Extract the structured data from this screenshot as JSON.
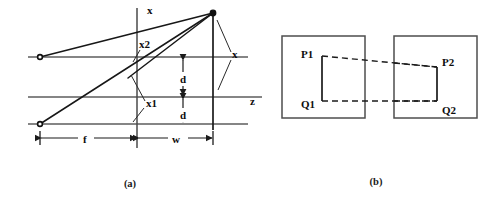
{
  "figure": {
    "panels": [
      {
        "id": "a",
        "caption": "(a)",
        "caption_pos": {
          "x": 130,
          "y": 186
        },
        "description": "Ray diagram with vertical x axis, horizontal z axis, three horizontal reference lines, two source points and one apex point.",
        "labels": {
          "x_axis_top": "x",
          "z_axis": "z",
          "x_right": "x",
          "x1": "x1",
          "x2": "x2",
          "d_upper": "d",
          "d_lower": "d",
          "f": "f",
          "w": "w"
        }
      },
      {
        "id": "b",
        "caption": "(b)",
        "caption_pos": {
          "x": 376,
          "y": 184
        },
        "description": "Two image frames with corresponding vertical segments linked by dashed correspondence lines.",
        "labels": {
          "p1": "P1",
          "q1": "Q1",
          "p2": "P2",
          "q2": "Q2"
        }
      }
    ]
  },
  "panel_a": {
    "horizontal_lines": [
      {
        "name": "upper-reference-line",
        "x1": 28,
        "y": 57,
        "x2": 248
      },
      {
        "name": "middle-axis-line",
        "x1": 28,
        "y": 97,
        "x2": 262
      },
      {
        "name": "lower-reference-line",
        "x1": 28,
        "y": 124,
        "x2": 248
      }
    ],
    "vertical_axis": {
      "name": "x-axis",
      "x": 137,
      "y1": 8,
      "y2": 148
    },
    "right_vertical": {
      "name": "image-plane-bar",
      "x": 213,
      "y1": 13,
      "y2": 130
    },
    "points": [
      {
        "name": "upper-left-source",
        "x": 40,
        "y": 57,
        "style": "open"
      },
      {
        "name": "lower-left-source",
        "x": 40,
        "y": 124,
        "style": "open"
      },
      {
        "name": "apex-point",
        "x": 213,
        "y": 13,
        "style": "filled"
      }
    ],
    "rays": [
      {
        "name": "ray-upper-left-to-apex",
        "x1": 40,
        "y1": 57,
        "x2": 213,
        "y2": 13
      },
      {
        "name": "ray-lower-left-to-apex",
        "x1": 40,
        "y1": 124,
        "x2": 213,
        "y2": 13
      },
      {
        "name": "ray-apex-to-axis-crossing",
        "x1": 213,
        "y1": 13,
        "x2": 130,
        "y2": 76
      }
    ],
    "labels": {
      "x_top": {
        "text": "x",
        "x": 147,
        "y": 13
      },
      "x2": {
        "text": "x2",
        "x": 139,
        "y": 46
      },
      "x1": {
        "text": "x1",
        "x": 146,
        "y": 104
      },
      "x_right": {
        "text": "x",
        "x": 233,
        "y": 56
      },
      "z": {
        "text": "z",
        "x": 252,
        "y": 102
      },
      "d_upper": {
        "text": "d",
        "x": 187,
        "y": 79
      },
      "d_lower": {
        "text": "d",
        "x": 187,
        "y": 115
      },
      "f": {
        "text": "f",
        "x": 86,
        "y": 142
      },
      "w": {
        "text": "w",
        "x": 177,
        "y": 142
      }
    },
    "dimensions": [
      {
        "name": "f-dimension",
        "label": "f",
        "x1": 40,
        "x2": 137,
        "y": 138
      },
      {
        "name": "w-dimension",
        "label": "w",
        "x1": 137,
        "x2": 213,
        "y": 138
      },
      {
        "name": "d-upper-dimension",
        "label": "d",
        "x": 183,
        "y1": 60,
        "y2": 95
      },
      {
        "name": "d-lower-dimension",
        "label": "d",
        "x": 183,
        "y1": 99,
        "y2": 122
      }
    ]
  },
  "panel_b": {
    "frames": [
      {
        "name": "left-image-frame",
        "x": 282,
        "y": 36,
        "width": 83,
        "height": 82
      },
      {
        "name": "right-image-frame",
        "x": 394,
        "y": 36,
        "width": 83,
        "height": 82
      }
    ],
    "segments": [
      {
        "name": "segment-p1-q1",
        "x": 322,
        "y1": 56,
        "y2": 101
      },
      {
        "name": "segment-p2-q2",
        "x": 437,
        "y1": 67,
        "y2": 101
      }
    ],
    "dashed_links": [
      {
        "name": "correspondence-line-p1-p2",
        "x1": 322,
        "y1": 56,
        "x2": 437,
        "y2": 67
      },
      {
        "name": "correspondence-line-q1-q2",
        "x1": 322,
        "y1": 101,
        "x2": 437,
        "y2": 101
      }
    ],
    "dashed_extensions": [
      {
        "name": "dash-extension-left-of-p2",
        "x1": 282,
        "y1": 63,
        "x2": 322,
        "y2": 56
      },
      {
        "name": "dash-extension-right-of-p1",
        "x1": 437,
        "y1": 67,
        "x2": 477,
        "y2": 71
      }
    ],
    "labels": {
      "p1": {
        "text": "P1",
        "x": 303,
        "y": 55
      },
      "q1": {
        "text": "Q1",
        "x": 303,
        "y": 106
      },
      "p2": {
        "text": "P2",
        "x": 443,
        "y": 65
      },
      "q2": {
        "text": "Q2",
        "x": 443,
        "y": 112
      }
    }
  },
  "colors": {
    "background": "#ffffff",
    "line_gray": "#5d5d5d",
    "line_black": "#171717",
    "text": "#0d0d0d"
  }
}
